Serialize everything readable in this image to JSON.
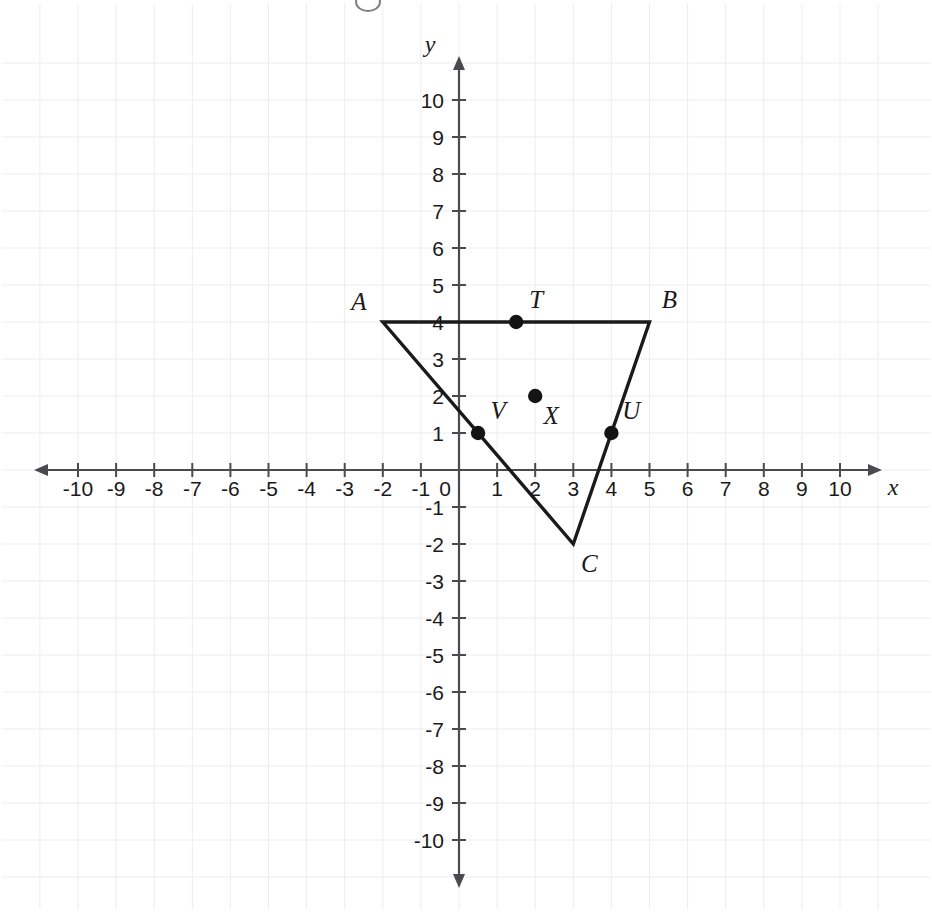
{
  "figure": {
    "type": "coordinate-plane-diagram",
    "background_color": "#ffffff",
    "ink_color": "#1a1a1a",
    "axis_color": "#4a4a4f",
    "grid_color": "#ededf0"
  },
  "axes": {
    "x_axis_name": "x",
    "y_axis_name": "y",
    "x_min": -10,
    "x_max": 10,
    "y_min": -10,
    "y_max": 10,
    "origin_label": "0",
    "x_tick_labels": [
      "-10",
      "-9",
      "-8",
      "-7",
      "-6",
      "-5",
      "-4",
      "-3",
      "-2",
      "-1",
      "0",
      "1",
      "2",
      "3",
      "4",
      "5",
      "6",
      "7",
      "8",
      "9",
      "10"
    ],
    "y_tick_labels_positive": [
      "1",
      "2",
      "3",
      "4",
      "5",
      "6",
      "7",
      "8",
      "9",
      "10"
    ],
    "y_tick_labels_negative": [
      "-1",
      "-2",
      "-3",
      "-4",
      "-5",
      "-6",
      "-7",
      "-8",
      "-9",
      "-10"
    ],
    "grid": "on",
    "arrows": "both-ends-both-axes"
  },
  "chart_data": {
    "type": "scatter",
    "title": "",
    "xlabel": "x",
    "ylabel": "y",
    "xlim": [
      -10,
      10
    ],
    "ylim": [
      -10,
      10
    ],
    "grid": true,
    "legend": "none",
    "shapes": [
      {
        "name": "triangle-ABC",
        "kind": "polygon",
        "closed": true,
        "vertices": [
          {
            "label": "A",
            "x": -2,
            "y": 4
          },
          {
            "label": "B",
            "x": 5,
            "y": 4
          },
          {
            "label": "C",
            "x": 3,
            "y": -2
          }
        ]
      }
    ],
    "points": [
      {
        "label": "T",
        "x": 1.5,
        "y": 4
      },
      {
        "label": "X",
        "x": 2,
        "y": 2
      },
      {
        "label": "V",
        "x": 0.5,
        "y": 1
      },
      {
        "label": "U",
        "x": 4,
        "y": 1
      }
    ],
    "vertex_labels": [
      {
        "label": "A",
        "x": -2,
        "y": 4,
        "anchor": "left-above"
      },
      {
        "label": "B",
        "x": 5,
        "y": 4,
        "anchor": "right-above"
      },
      {
        "label": "C",
        "x": 3,
        "y": -2,
        "anchor": "right-below"
      }
    ],
    "point_labels": [
      {
        "label": "T",
        "x": 1.5,
        "y": 4,
        "anchor": "right-above"
      },
      {
        "label": "X",
        "x": 2,
        "y": 2,
        "anchor": "right-below"
      },
      {
        "label": "V",
        "x": 0.5,
        "y": 1,
        "anchor": "right-above"
      },
      {
        "label": "U",
        "x": 4,
        "y": 1,
        "anchor": "right-above"
      }
    ]
  }
}
